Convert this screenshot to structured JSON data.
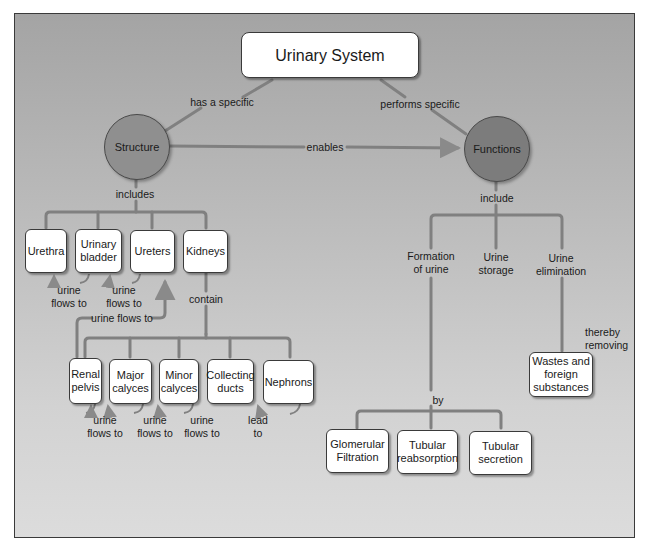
{
  "title": "Urinary System",
  "nodes": {
    "structure": "Structure",
    "functions": "Functions",
    "urethra": "Urethra",
    "urinary_bladder": "Urinary bladder",
    "ureters": "Ureters",
    "kidneys": "Kidneys",
    "renal_pelvis": "Renal pelvis",
    "major_calyces": "Major calyces",
    "minor_calyces": "Minor calyces",
    "collecting_ducts": "Collecting ducts",
    "nephrons": "Nephrons",
    "formation_of_urine": "Formation of urine",
    "urine_storage": "Urine storage",
    "urine_elimination": "Urine elimination",
    "wastes": "Wastes and foreign substances",
    "glomerular_filtration": "Glomerular Filtration",
    "tubular_reabsorption": "Tubular reabsorption",
    "tubular_secretion": "Tubular secretion"
  },
  "links": {
    "has_a_specific": "has a specific",
    "performs_specific": "performs specific",
    "enables": "enables",
    "includes": "includes",
    "include": "include",
    "contain": "contain",
    "urine_flows_to": "urine flows to",
    "lead_to": "lead to",
    "thereby_removing": "thereby removing",
    "by": "by"
  },
  "colors": {
    "background_top": "#a4a4a4",
    "background_bottom": "#dcdcdc",
    "connector": "#7a7a7a",
    "structure_fill": "#8f8f8f",
    "functions_fill": "#7c7c7c",
    "box_fill": "#ffffff"
  }
}
